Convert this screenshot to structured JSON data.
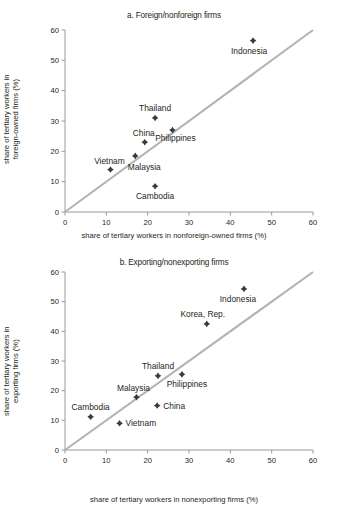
{
  "figure": {
    "background": "#ffffff",
    "marker_color": "#3b3b3b",
    "diagonal_color": "#b3b3b3",
    "axis_color": "#9a9a9a"
  },
  "panel_a": {
    "title": "a. Foreign/nonforeign firms",
    "xlabel": "share of tertiary workers in nonforeign-owned firms (%)",
    "ylabel_line1": "share of tertiary workers in",
    "ylabel_line2": "foreign-owned firms (%)",
    "xticks": [
      "0",
      "10",
      "20",
      "30",
      "40",
      "50",
      "60"
    ],
    "yticks": [
      "0",
      "10",
      "20",
      "30",
      "40",
      "50",
      "60"
    ],
    "labels": {
      "indonesia": "Indonesia",
      "thailand": "Thailand",
      "philippines": "Philippines",
      "china": "China",
      "malaysia": "Malaysia",
      "vietnam": "Vietnam",
      "cambodia": "Cambodia"
    }
  },
  "panel_b": {
    "title": "b. Exporting/nonexporting firms",
    "xlabel": "share of tertiary workers in nonexporting firms (%)",
    "ylabel_line1": "share of tertiary workers in",
    "ylabel_line2": "exporting firms (%)",
    "xticks": [
      "0",
      "10",
      "20",
      "30",
      "40",
      "50",
      "60"
    ],
    "yticks": [
      "0",
      "10",
      "20",
      "30",
      "40",
      "50",
      "60"
    ],
    "labels": {
      "indonesia": "Indonesia",
      "korea": "Korea, Rep.",
      "philippines": "Philippines",
      "thailand": "Thailand",
      "malaysia": "Malaysia",
      "china": "China",
      "cambodia": "Cambodia",
      "vietnam": "Vietnam"
    }
  },
  "chart_data": [
    {
      "type": "scatter",
      "title": "a. Foreign/nonforeign firms",
      "xlabel": "share of tertiary workers in nonforeign-owned firms (%)",
      "ylabel": "share of tertiary workers in foreign-owned firms (%)",
      "xlim": [
        0,
        60
      ],
      "ylim": [
        0,
        60
      ],
      "xticks": [
        0,
        10,
        20,
        30,
        40,
        50,
        60
      ],
      "yticks": [
        0,
        10,
        20,
        30,
        40,
        50,
        60
      ],
      "grid": false,
      "legend": "none",
      "reference_line": {
        "type": "identity",
        "from": [
          0,
          0
        ],
        "to": [
          60,
          60
        ],
        "color": "#b3b3b3"
      },
      "points": [
        {
          "label": "Indonesia",
          "x": 45.5,
          "y": 56.5
        },
        {
          "label": "Thailand",
          "x": 21.8,
          "y": 31.0
        },
        {
          "label": "Philippines",
          "x": 26.0,
          "y": 27.0
        },
        {
          "label": "China",
          "x": 19.3,
          "y": 23.0
        },
        {
          "label": "Malaysia",
          "x": 17.0,
          "y": 18.5
        },
        {
          "label": "Vietnam",
          "x": 11.0,
          "y": 14.0
        },
        {
          "label": "Cambodia",
          "x": 21.8,
          "y": 8.5
        }
      ]
    },
    {
      "type": "scatter",
      "title": "b. Exporting/nonexporting firms",
      "xlabel": "share of tertiary workers in nonexporting firms (%)",
      "ylabel": "share of tertiary workers in exporting firms (%)",
      "xlim": [
        0,
        60
      ],
      "ylim": [
        0,
        60
      ],
      "xticks": [
        0,
        10,
        20,
        30,
        40,
        50,
        60
      ],
      "yticks": [
        0,
        10,
        20,
        30,
        40,
        50,
        60
      ],
      "grid": false,
      "legend": "none",
      "reference_line": {
        "type": "identity",
        "from": [
          0,
          0
        ],
        "to": [
          60,
          60
        ],
        "color": "#b3b3b3"
      },
      "points": [
        {
          "label": "Indonesia",
          "x": 43.3,
          "y": 54.3
        },
        {
          "label": "Korea, Rep.",
          "x": 34.3,
          "y": 42.5
        },
        {
          "label": "Philippines",
          "x": 28.3,
          "y": 25.5
        },
        {
          "label": "Thailand",
          "x": 22.5,
          "y": 25.0
        },
        {
          "label": "Malaysia",
          "x": 17.3,
          "y": 17.8
        },
        {
          "label": "China",
          "x": 22.3,
          "y": 15.0
        },
        {
          "label": "Cambodia",
          "x": 6.2,
          "y": 11.2
        },
        {
          "label": "Vietnam",
          "x": 13.2,
          "y": 9.0
        }
      ]
    }
  ]
}
